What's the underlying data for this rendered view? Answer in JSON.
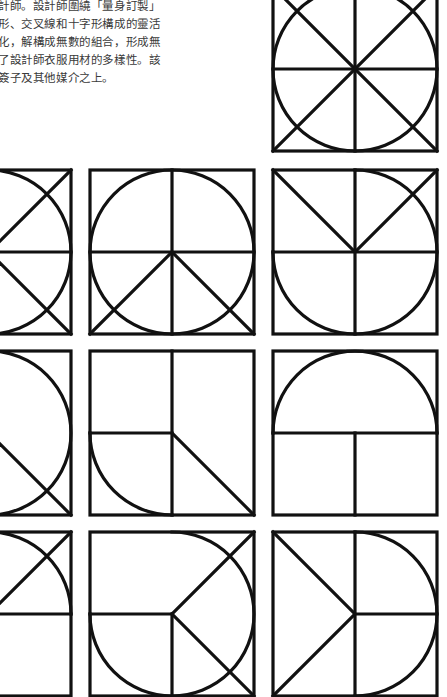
{
  "description": {
    "lines": [
      "計師。設計師圍繞「量身訂製」",
      "形、交叉線和十字形構成的靈活",
      "化，解構成無數的組合，形成無",
      "了設計師衣服用材的多樣性。該",
      "簽子及其他媒介之上。"
    ]
  },
  "colors": {
    "stroke": "#111111",
    "background": "#ffffff",
    "text": "#3a3a3a"
  },
  "glyph_grid": {
    "size": 164,
    "stroke_width": 3.2,
    "tiles": [
      {
        "name": "glyph-full-circle-cross",
        "x": 273,
        "y": -13,
        "parts": [
          "frame",
          "circle",
          "diag-tl-br",
          "diag-tr-bl",
          "h-full",
          "v-full"
        ]
      },
      {
        "name": "glyph-right-semicircle-chevron",
        "x": -93,
        "y": 170,
        "parts": [
          "frame",
          "arc-right-half",
          "c-tr",
          "c-br",
          "h-full"
        ]
      },
      {
        "name": "glyph-peace",
        "x": 90,
        "y": 170,
        "parts": [
          "frame",
          "circle",
          "v-full",
          "h-full",
          "c-bl",
          "c-br"
        ]
      },
      {
        "name": "glyph-d-split",
        "x": 273,
        "y": 170,
        "parts": [
          "frame",
          "arc-right-half-and-bottom-left",
          "c-tl",
          "c-tr",
          "h-full",
          "v-full"
        ]
      },
      {
        "name": "glyph-right-semicircle-slash",
        "x": -93,
        "y": 351,
        "parts": [
          "frame",
          "arc-right-half",
          "c-br"
        ]
      },
      {
        "name": "glyph-quarter-diagonal",
        "x": 90,
        "y": 351,
        "parts": [
          "frame",
          "v-full",
          "h-left",
          "c-br",
          "arc-bottom-left"
        ]
      },
      {
        "name": "glyph-arch",
        "x": 273,
        "y": 351,
        "parts": [
          "frame",
          "arc-top-half",
          "h-full",
          "v-bottom"
        ]
      },
      {
        "name": "glyph-quarter-arc-slash",
        "x": -93,
        "y": 532,
        "parts": [
          "frame",
          "arc-top-right",
          "c-tr",
          "h-full"
        ]
      },
      {
        "name": "glyph-three-quarter-arrow",
        "x": 90,
        "y": 532,
        "parts": [
          "frame",
          "arc-three-quarter",
          "h-left",
          "v-bottom",
          "c-tr",
          "c-br"
        ]
      },
      {
        "name": "glyph-d-arrow",
        "x": 273,
        "y": 532,
        "parts": [
          "frame",
          "arc-right-half",
          "c-tl",
          "c-bl",
          "v-full",
          "h-right"
        ]
      }
    ]
  }
}
